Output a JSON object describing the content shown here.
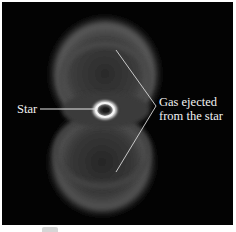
{
  "figure": {
    "labels": {
      "star": "Star",
      "gas_line1": "Gas ejected",
      "gas_line2": "from the star"
    },
    "colors": {
      "background": "#030303",
      "label_text": "#f2f2f2",
      "pointer_lines": "#e0e0e0"
    }
  }
}
